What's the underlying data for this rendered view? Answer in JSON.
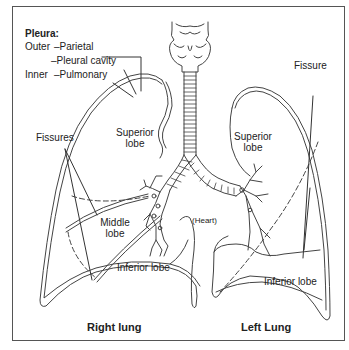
{
  "diagram": {
    "pleura": {
      "title": "Pleura:",
      "outer_label": "Outer",
      "parietal": "–Parietal",
      "pleural_cavity": "–Pleural cavity",
      "inner_label": "Inner",
      "pulmonary": "–Pulmonary"
    },
    "right_lung": {
      "title": "Right lung",
      "fissures": "Fissures",
      "superior_lobe_1": "Superior",
      "superior_lobe_2": "lobe",
      "middle_lobe_1": "Middle",
      "middle_lobe_2": "lobe",
      "inferior_lobe": "Inferior lobe"
    },
    "left_lung": {
      "title": "Left Lung",
      "fissure": "Fissure",
      "superior_lobe_1": "Superior",
      "superior_lobe_2": "lobe",
      "inferior_lobe": "Inferior lobe"
    },
    "heart": "(Heart)",
    "colors": {
      "line": "#444444",
      "frame": "#555555",
      "background": "#ffffff"
    }
  }
}
